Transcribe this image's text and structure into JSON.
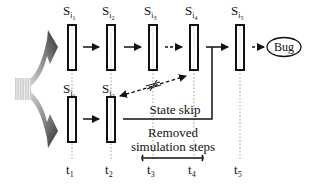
{
  "diagram": {
    "top_row": {
      "states": [
        {
          "label": "S",
          "sub": "i",
          "subsub": "1",
          "time": "t1"
        },
        {
          "label": "S",
          "sub": "i",
          "subsub": "2",
          "time": "t2"
        },
        {
          "label": "S",
          "sub": "i",
          "subsub": "3",
          "time": "t3"
        },
        {
          "label": "S",
          "sub": "i",
          "subsub": "4",
          "time": "t4"
        },
        {
          "label": "S",
          "sub": "i",
          "subsub": "5",
          "time": "t5"
        }
      ],
      "terminal": "Bug"
    },
    "bottom_row": {
      "states": [
        {
          "label": "S",
          "sub": "j",
          "subsub": "1",
          "time": "t1"
        },
        {
          "label": "S",
          "sub": "j",
          "subsub": "2",
          "time": "t2"
        }
      ]
    },
    "time_axis": [
      {
        "label": "t",
        "sub": "1"
      },
      {
        "label": "t",
        "sub": "2"
      },
      {
        "label": "t",
        "sub": "3"
      },
      {
        "label": "t",
        "sub": "4"
      },
      {
        "label": "t",
        "sub": "5"
      }
    ],
    "annotations": {
      "state_skip": "State skip",
      "removed_line1": "Removed",
      "removed_line2": "simulation steps"
    },
    "colors": {
      "stroke": "#111111",
      "box_fill": "#ffffff",
      "time_guide": "#9a9a9a",
      "fork_dark": "#3a3a3a",
      "fork_light": "#bdbdbd"
    }
  }
}
